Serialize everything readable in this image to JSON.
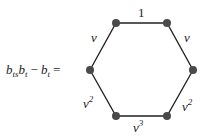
{
  "equation": {
    "lhs_b1": "b",
    "lhs_sub1": "ts",
    "lhs_b2": "b",
    "lhs_sub2": "t",
    "minus": "−",
    "lhs_b3": "b",
    "lhs_sub3": "t",
    "equals": "="
  },
  "graph": {
    "shape": "hexagon",
    "vertex_color": "#4a4a4a",
    "edge_color": "#222222",
    "vertices": [
      {
        "id": "top-left",
        "x": 116,
        "y": 23
      },
      {
        "id": "top-right",
        "x": 167,
        "y": 23
      },
      {
        "id": "right",
        "x": 193,
        "y": 70
      },
      {
        "id": "bottom-right",
        "x": 167,
        "y": 116
      },
      {
        "id": "bottom-left",
        "x": 116,
        "y": 116
      },
      {
        "id": "left",
        "x": 90,
        "y": 70
      }
    ],
    "edges": [
      {
        "from": "top-left",
        "to": "top-right",
        "label": "1",
        "sup": ""
      },
      {
        "from": "top-right",
        "to": "right",
        "label": "v",
        "sup": ""
      },
      {
        "from": "right",
        "to": "bottom-right",
        "label": "v",
        "sup": "2"
      },
      {
        "from": "bottom-right",
        "to": "bottom-left",
        "label": "v",
        "sup": "3"
      },
      {
        "from": "bottom-left",
        "to": "left",
        "label": "v",
        "sup": "2"
      },
      {
        "from": "left",
        "to": "top-left",
        "label": "v",
        "sup": ""
      }
    ]
  }
}
